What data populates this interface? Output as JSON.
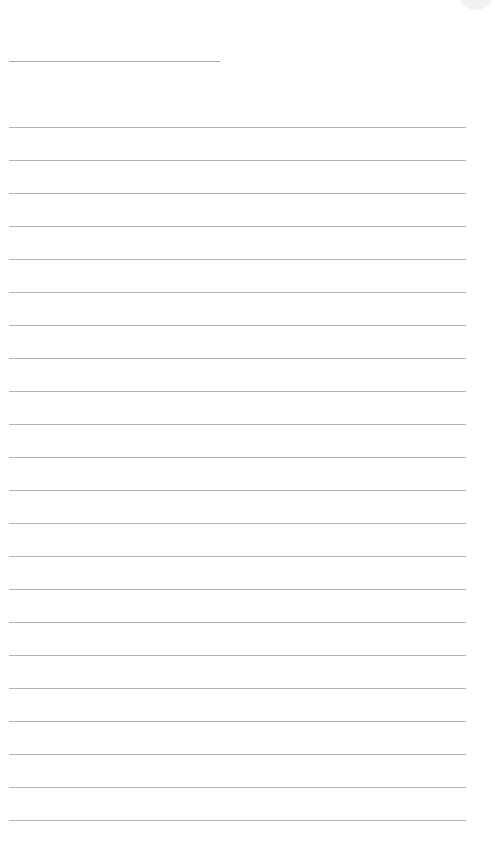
{
  "page": {
    "type": "blank lined note page",
    "background": "#ffffff",
    "line_color": "#b3b3b3"
  },
  "title_field": {
    "text": "",
    "line": {
      "x": 9,
      "y": 61,
      "width": 211
    }
  },
  "body": {
    "first_line_y": 127,
    "line_spacing": 33,
    "line_x": 9,
    "line_width": 457,
    "lines": [
      {
        "text": ""
      },
      {
        "text": ""
      },
      {
        "text": ""
      },
      {
        "text": ""
      },
      {
        "text": ""
      },
      {
        "text": ""
      },
      {
        "text": ""
      },
      {
        "text": ""
      },
      {
        "text": ""
      },
      {
        "text": ""
      },
      {
        "text": ""
      },
      {
        "text": ""
      },
      {
        "text": ""
      },
      {
        "text": ""
      },
      {
        "text": ""
      },
      {
        "text": ""
      },
      {
        "text": ""
      },
      {
        "text": ""
      },
      {
        "text": ""
      },
      {
        "text": ""
      },
      {
        "text": ""
      },
      {
        "text": ""
      }
    ]
  },
  "corner_button": {
    "icon": "circle-icon",
    "color": "#f1f1f1"
  }
}
